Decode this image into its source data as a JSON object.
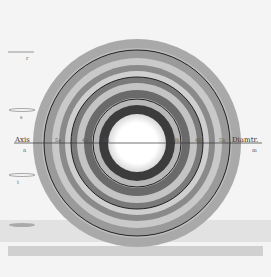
{
  "figure": {
    "center": {
      "x": 137,
      "y": 143
    },
    "background": "#f4f4f4",
    "rings": [
      {
        "r": 104,
        "fill": "#a9a9a9"
      },
      {
        "r": 95,
        "fill": "#bdbdbd"
      },
      {
        "r": 93,
        "fill": "#9a9a9a"
      },
      {
        "r": 85,
        "fill": "#c9c9c9"
      },
      {
        "r": 78,
        "fill": "#8a8a8a"
      },
      {
        "r": 72,
        "fill": "#cfcfcf"
      },
      {
        "r": 66,
        "fill": "#7a7a7a"
      },
      {
        "r": 60,
        "fill": "#c4c4c4"
      },
      {
        "r": 53,
        "fill": "#6a6a6a"
      },
      {
        "r": 45,
        "fill": "#b8b8b8"
      },
      {
        "r": 38,
        "fill": "#3c3c3c"
      },
      {
        "r": 29,
        "fill": "#ffffff"
      }
    ],
    "dark_lines": [
      93,
      66,
      44
    ]
  },
  "labels": {
    "axis": "Axis",
    "axis_sub_left": "n",
    "diameter": "Diamtr.",
    "diameter_sub_right": "m",
    "ring_marks_left": [
      "5a",
      "4a",
      "3a"
    ],
    "ring_marks_right": [
      "3b",
      "4b",
      "5b"
    ],
    "side_marks": [
      "r",
      "s",
      "t",
      "u"
    ]
  }
}
